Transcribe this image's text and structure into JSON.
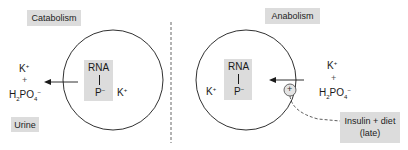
{
  "diagram": {
    "left_panel": {
      "title": "Catabolism",
      "cell": {
        "box_top": "RNA",
        "box_bottom_base": "P",
        "box_bottom_sup": "−",
        "ion_base": "K",
        "ion_sup": "+"
      },
      "outside": {
        "ion_base": "K",
        "ion_sup": "+",
        "plus": "+",
        "phosphate_h": "H",
        "phosphate_h_sub": "2",
        "phosphate_po": "PO",
        "phosphate_po_sub": "4",
        "phosphate_sup": "−"
      },
      "destination": "Urine",
      "arrow_direction": "out of cell"
    },
    "right_panel": {
      "title": "Anabolism",
      "cell": {
        "box_top": "RNA",
        "box_bottom_base": "P",
        "box_bottom_sup": "−",
        "ion_base": "K",
        "ion_sup": "+"
      },
      "outside": {
        "ion_base": "K",
        "ion_sup": "+",
        "plus": "+",
        "phosphate_h": "H",
        "phosphate_h_sub": "2",
        "phosphate_po": "PO",
        "phosphate_po_sub": "4",
        "phosphate_sup": "−"
      },
      "stimulator_symbol": "+",
      "stimulus_line1": "Insulin + diet",
      "stimulus_line2": "(late)",
      "arrow_direction": "into cell"
    },
    "colors": {
      "label_bg": "#dcdcdc",
      "line": "#1a1a1a",
      "divider": "#555555"
    }
  }
}
